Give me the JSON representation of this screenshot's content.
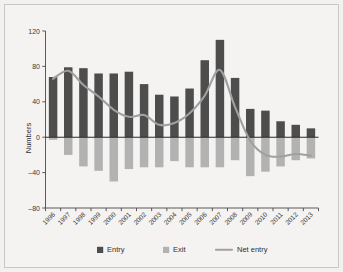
{
  "chart_data": {
    "type": "bar",
    "title": "",
    "xlabel": "",
    "ylabel": "Numbers",
    "ylim": [
      -80,
      120
    ],
    "yticks": [
      -80,
      -40,
      0,
      40,
      80,
      120
    ],
    "ytick_labels": [
      "–80",
      "–40",
      "0",
      "40",
      "80",
      "120"
    ],
    "grid": false,
    "legend_position": "bottom",
    "categories": [
      "1996",
      "1997",
      "1998",
      "1999",
      "2000",
      "2001",
      "2002",
      "2003",
      "2004",
      "2005",
      "2006",
      "2007",
      "2008",
      "2009",
      "2010",
      "2011",
      "2012",
      "2013"
    ],
    "series": [
      {
        "name": "Entry",
        "kind": "bar",
        "color": "#4d4d4d",
        "values": [
          68,
          79,
          78,
          72,
          72,
          74,
          60,
          48,
          46,
          55,
          87,
          110,
          67,
          32,
          30,
          18,
          14,
          10
        ]
      },
      {
        "name": "Exit",
        "kind": "bar",
        "color": "#b2b2b2",
        "values": [
          -3,
          -20,
          -33,
          -38,
          -50,
          -36,
          -34,
          -34,
          -27,
          -34,
          -34,
          -34,
          -26,
          -44,
          -39,
          -33,
          -26,
          -24
        ]
      },
      {
        "name": "Net entry",
        "kind": "line",
        "color": "#a0a0a0",
        "values": [
          66,
          75,
          59,
          46,
          31,
          23,
          25,
          14,
          16,
          27,
          47,
          76,
          34,
          -4,
          -20,
          -22,
          -19,
          -21
        ]
      }
    ]
  },
  "axis": {
    "ylabel": "Numbers"
  },
  "legend": {
    "items": [
      {
        "label": "Entry",
        "marker": "square",
        "color": "#4d4d4d"
      },
      {
        "label": "Exit",
        "marker": "square",
        "color": "#b2b2b2"
      },
      {
        "label": "Net entry",
        "marker": "line",
        "color": "#a0a0a0"
      }
    ]
  },
  "colors": {
    "entry": "#4d4d4d",
    "exit": "#b2b2b2",
    "net_entry": "#a0a0a0",
    "background": "#f4f3f1",
    "axis": "#4a4a4a",
    "text": "#2f2f2f"
  }
}
